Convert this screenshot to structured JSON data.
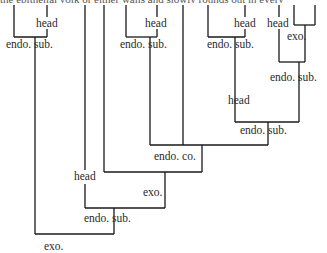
{
  "caption_fragment": "the epithelial yolk or either walls and slowly rounds out in every",
  "labels": [
    {
      "id": "head-1",
      "text": "head",
      "x": 36,
      "y": 27
    },
    {
      "id": "endo-sub-1",
      "text": "endo. sub.",
      "x": 6,
      "y": 48
    },
    {
      "id": "head-2",
      "text": "head",
      "x": 145,
      "y": 27
    },
    {
      "id": "endo-sub-2",
      "text": "endo. sub.",
      "x": 120,
      "y": 48
    },
    {
      "id": "head-3",
      "text": "head",
      "x": 234,
      "y": 27
    },
    {
      "id": "endo-sub-3",
      "text": "endo. sub.",
      "x": 207,
      "y": 48
    },
    {
      "id": "head-4",
      "text": "head",
      "x": 267,
      "y": 27
    },
    {
      "id": "exo-1",
      "text": "exo.",
      "x": 287,
      "y": 40
    },
    {
      "id": "endo-sub-4",
      "text": "endo. sub.",
      "x": 270,
      "y": 81
    },
    {
      "id": "head-5",
      "text": "head",
      "x": 228,
      "y": 104
    },
    {
      "id": "endo-sub-5",
      "text": "endo. sub.",
      "x": 240,
      "y": 134
    },
    {
      "id": "endo-co",
      "text": "endo. co.",
      "x": 154,
      "y": 160
    },
    {
      "id": "head-6",
      "text": "head",
      "x": 74,
      "y": 180
    },
    {
      "id": "exo-2",
      "text": "exo.",
      "x": 143,
      "y": 196
    },
    {
      "id": "endo-sub-6",
      "text": "endo. sub.",
      "x": 84,
      "y": 222
    },
    {
      "id": "exo-3",
      "text": "exo.",
      "x": 44,
      "y": 250
    }
  ]
}
